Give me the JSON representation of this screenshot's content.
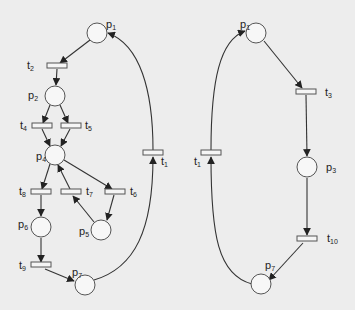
{
  "diagram": {
    "type": "petri-net",
    "nets": [
      {
        "id": "left",
        "places": [
          {
            "name": "p",
            "sub": "1",
            "x": 97,
            "y": 33
          },
          {
            "name": "p",
            "sub": "2",
            "x": 55,
            "y": 96
          },
          {
            "name": "p",
            "sub": "4",
            "x": 55,
            "y": 155
          },
          {
            "name": "p",
            "sub": "6",
            "x": 41,
            "y": 227
          },
          {
            "name": "p",
            "sub": "5",
            "x": 101,
            "y": 230
          },
          {
            "name": "p",
            "sub": "7",
            "x": 85,
            "y": 285
          }
        ],
        "transitions": [
          {
            "name": "t",
            "sub": "2",
            "x": 57,
            "y": 66
          },
          {
            "name": "t",
            "sub": "4",
            "x": 42,
            "y": 126
          },
          {
            "name": "t",
            "sub": "5",
            "x": 70,
            "y": 126
          },
          {
            "name": "t",
            "sub": "8",
            "x": 41,
            "y": 192
          },
          {
            "name": "t",
            "sub": "7",
            "x": 70,
            "y": 192
          },
          {
            "name": "t",
            "sub": "6",
            "x": 114,
            "y": 192
          },
          {
            "name": "t",
            "sub": "9",
            "x": 41,
            "y": 266
          },
          {
            "name": "t",
            "sub": "1",
            "x": 153,
            "y": 153
          }
        ],
        "arcs": [
          "p1->t2",
          "t2->p2",
          "p2->t4",
          "p2->t5",
          "t4->p4",
          "t5->p4",
          "p4->t8",
          "p4->t6",
          "t7->p4",
          "t8->p6",
          "t6->p5",
          "p5->t7",
          "p6->t9",
          "t9->p7",
          "p7->t1",
          "t1->p1"
        ]
      },
      {
        "id": "right",
        "places": [
          {
            "name": "p",
            "sub": "1",
            "x": 256,
            "y": 33
          },
          {
            "name": "p",
            "sub": "3",
            "x": 307,
            "y": 167
          },
          {
            "name": "p",
            "sub": "7",
            "x": 261,
            "y": 284
          }
        ],
        "transitions": [
          {
            "name": "t",
            "sub": "3",
            "x": 304,
            "y": 92
          },
          {
            "name": "t",
            "sub": "10",
            "x": 307,
            "y": 239
          },
          {
            "name": "t",
            "sub": "1",
            "x": 211,
            "y": 153
          }
        ],
        "arcs": [
          "p1->t3",
          "t3->p3",
          "p3->t10",
          "t10->p7",
          "p7->t1",
          "t1->p1"
        ]
      }
    ]
  },
  "labels": {
    "L_p1": "p",
    "L_p1s": "1",
    "L_p2": "p",
    "L_p2s": "2",
    "L_p4": "p",
    "L_p4s": "4",
    "L_p6": "p",
    "L_p6s": "6",
    "L_p5": "p",
    "L_p5s": "5",
    "L_p7": "p",
    "L_p7s": "7",
    "L_t2": "t",
    "L_t2s": "2",
    "L_t4": "t",
    "L_t4s": "4",
    "L_t5": "t",
    "L_t5s": "5",
    "L_t8": "t",
    "L_t8s": "8",
    "L_t7": "t",
    "L_t7s": "7",
    "L_t6": "t",
    "L_t6s": "6",
    "L_t9": "t",
    "L_t9s": "9",
    "L_t1": "t",
    "L_t1s": "1",
    "R_p1": "p",
    "R_p1s": "1",
    "R_p3": "p",
    "R_p3s": "3",
    "R_p7": "p",
    "R_p7s": "7",
    "R_t3": "t",
    "R_t3s": "3",
    "R_t10": "t",
    "R_t10s": "10",
    "R_t1": "t",
    "R_t1s": "1"
  }
}
